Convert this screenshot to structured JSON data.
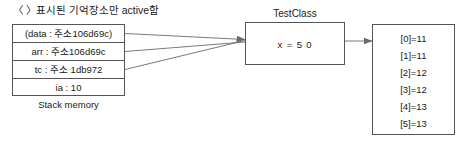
{
  "header": {
    "note": "〈 〉표시된 기억장소만 active함"
  },
  "stack_memory": {
    "caption": "Stack memory",
    "rows": [
      {
        "label": "(data : 주소106d69c)"
      },
      {
        "label": "arr : 주소106d69c"
      },
      {
        "label": "tc : 주소 1db972"
      },
      {
        "label": "ia : 10"
      }
    ]
  },
  "test_class": {
    "title": "TestClass",
    "value": "x = 5 0"
  },
  "array_object": {
    "entries": [
      {
        "label": "[0]=11"
      },
      {
        "label": "[1]=11"
      },
      {
        "label": "[2]=12"
      },
      {
        "label": "[3]=12"
      },
      {
        "label": "[4]=13"
      },
      {
        "label": "[5]=13"
      }
    ]
  },
  "colors": {
    "stroke": "#555555",
    "connector": "#6b6b6b",
    "text": "#1a1a1a",
    "background": "#ffffff"
  }
}
